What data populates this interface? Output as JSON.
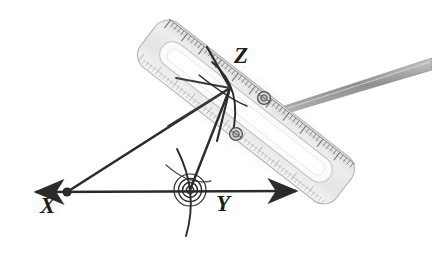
{
  "figure": {
    "kind": "geometry-construction-diagram",
    "background_color": "#ffffff",
    "ink_color": "#2b2b2b",
    "tool_fill_color": "#e8e8e8",
    "tool_edge_color": "#b4b4b4",
    "pencil_color": "#9a9a9a"
  },
  "labels": {
    "x": {
      "text": "X",
      "left": 40,
      "top": 194
    },
    "y": {
      "text": "Y",
      "left": 216,
      "top": 192
    },
    "z": {
      "text": "Z",
      "left": 234,
      "top": 44
    }
  },
  "geometry": {
    "baseline": {
      "name": "double-headed-ray-XY",
      "x1": 27,
      "y1": 192,
      "x2": 304,
      "y2": 191
    },
    "vertex_point": {
      "name": "vertex-X",
      "cx": 67,
      "cy": 192,
      "r": 4.6
    },
    "ray_to_z": {
      "name": "ray-X-to-Z",
      "x1": 67,
      "y1": 192,
      "x2": 229,
      "y2": 89
    },
    "segment_y_to_z": {
      "name": "segment-Y-to-Z",
      "x1": 190,
      "y1": 190,
      "x2": 229,
      "y2": 89
    },
    "construction_line_down": {
      "name": "construction-line-from-Z",
      "x1": 229,
      "y1": 89,
      "x2": 216,
      "y2": 140
    },
    "construction_line_up_left": {
      "name": "construction-line-up-left-from-Z",
      "x1": 229,
      "y1": 89,
      "x2": 208,
      "y2": 48
    },
    "construction_line_left": {
      "name": "construction-line-left-from-Z",
      "x1": 229,
      "y1": 89,
      "x2": 177,
      "y2": 79
    },
    "arc_through_z": {
      "name": "compass-arc-through-Z",
      "d": "M 213 63 Q 243 86 233 134"
    },
    "arc_secondary": {
      "name": "compass-arc-secondary",
      "d": "M 200 76 Q 228 98 243 104"
    },
    "arc_at_y": {
      "name": "compass-arc-at-Y",
      "d": "M 178 150 Q 198 192 186 235"
    },
    "target_y": {
      "name": "protractor-center-target-Y",
      "cx": 190,
      "cy": 190,
      "radii": [
        4,
        8,
        12,
        16
      ]
    },
    "rivet_upper": {
      "name": "ruler-rivet-upper",
      "cx": 264,
      "cy": 98,
      "r": 6
    },
    "rivet_lower": {
      "name": "ruler-rivet-lower",
      "cx": 236,
      "cy": 134,
      "r": 6
    }
  },
  "tools": {
    "ruler": {
      "name": "transparent-ruler",
      "angle_deg": -52,
      "tick_count": 54,
      "top_end": {
        "x": 320,
        "y": 16
      },
      "bottom_end": {
        "x": 172,
        "y": 208
      }
    },
    "pencil": {
      "name": "pencil-rod",
      "x1": 272,
      "y1": 105,
      "x2": 432,
      "y2": 64
    }
  }
}
